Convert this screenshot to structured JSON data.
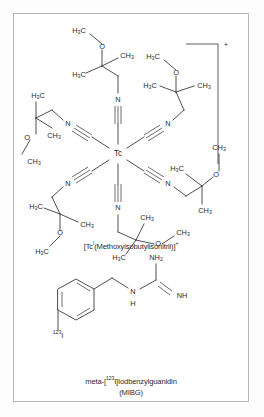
{
  "figure": {
    "border_color": "#b8b8b8",
    "background": "#ffffff",
    "bond_color": "#3a3a3a",
    "text_color": "#2a2a2a"
  },
  "structures": [
    {
      "id": "tc-sestamibi",
      "name": "Tc(I) hexakis methoxyisobutylisonitrile complex",
      "center_atom": "Tc",
      "charge": "+",
      "ligand_count": 6,
      "ligand_repeat_unit": "N≡C–CH₂–C(CH₃)₂–O–CH₃",
      "caption_parts": {
        "pre": "[Tc",
        "oxidation_state": "I",
        "mid": "(Methoxyisobutylisonitril)]",
        "charge": "+"
      },
      "caption_full": "[TcI(Methoxyisobutylisonitril)]+"
    },
    {
      "id": "mibg",
      "name": "meta-iodobenzylguanidine",
      "isotope": "123",
      "halogen": "I",
      "caption_line1_parts": {
        "pre": "meta-[",
        "isotope": "123",
        "post": "I]Iodbenzylguanidin"
      },
      "caption_line1_full": "meta-[123I]Iodbenzylguanidin",
      "caption_line2": "(MIBG)"
    }
  ],
  "atom_labels": {
    "tc": "Tc",
    "n": "N",
    "o": "O",
    "i": "I",
    "h": "H",
    "ch3": "CH",
    "h3c": "H",
    "ch3_sub": "3",
    "nh": "NH",
    "nh2_sub": "2",
    "plus": "+"
  },
  "tc_ligand_labels": {
    "methyl_right": "CH3",
    "methyl_left": "H3C",
    "oxygen": "O",
    "nitrogen": "N"
  },
  "mibg_labels": {
    "nh2": "NH2",
    "nh": "NH",
    "n": "N",
    "h": "H",
    "iodine": "I",
    "isotope": "123"
  }
}
